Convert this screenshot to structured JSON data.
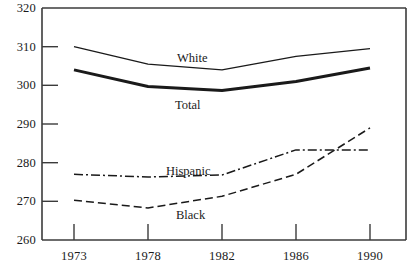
{
  "chart_data": {
    "type": "line",
    "title": "",
    "subtitle": "",
    "xlabel": "",
    "ylabel": "",
    "categories": [
      "1973",
      "1978",
      "1982",
      "1986",
      "1990"
    ],
    "ylim": [
      260,
      320
    ],
    "yticks": [
      "260",
      "270",
      "280",
      "290",
      "300",
      "310",
      "320"
    ],
    "ytick_values": [
      260,
      270,
      280,
      290,
      300,
      310,
      320
    ],
    "grid": false,
    "legend_position": "inline-annotations",
    "series": [
      {
        "name": "White",
        "label": "White",
        "style": "solid-thin",
        "color": "#1a1a1a",
        "values": [
          310.0,
          305.5,
          304.0,
          307.5,
          309.5
        ]
      },
      {
        "name": "Total",
        "label": "Total",
        "style": "solid-thick",
        "color": "#1a1a1a",
        "values": [
          304.0,
          299.7,
          298.7,
          301.0,
          304.5
        ]
      },
      {
        "name": "Hispanic",
        "label": "Hispanic",
        "style": "dash-dot",
        "color": "#1a1a1a",
        "values": [
          277.0,
          276.3,
          276.8,
          283.3,
          283.3
        ]
      },
      {
        "name": "Black",
        "label": "Black",
        "style": "dashed",
        "color": "#1a1a1a",
        "values": [
          270.3,
          268.3,
          271.3,
          277.0,
          289.0
        ]
      }
    ],
    "annotations": [
      {
        "text": "White",
        "x_px": 177,
        "y_px": 51
      },
      {
        "text": "Total",
        "x_px": 175,
        "y_px": 98
      },
      {
        "text": "Hispanic",
        "x_px": 166,
        "y_px": 164
      },
      {
        "text": "Black",
        "x_px": 176,
        "y_px": 208
      }
    ],
    "axis_color": "#3b3b3b",
    "background": "#ffffff"
  }
}
